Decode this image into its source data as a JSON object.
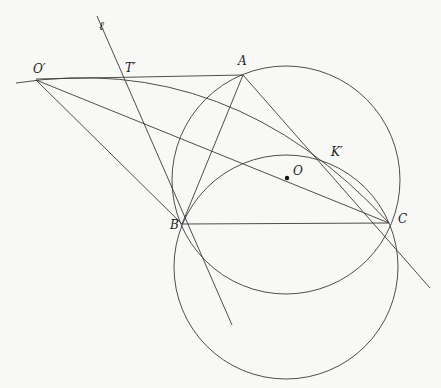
{
  "diagram": {
    "title": "",
    "stroke_color": "#3a3a3a",
    "points": {
      "O_prime": {
        "label": "O′",
        "x": 36,
        "y": 80
      },
      "T_prime": {
        "label": "T′",
        "x": 122,
        "y": 77
      },
      "A": {
        "label": "A",
        "x": 243,
        "y": 75
      },
      "K_prime": {
        "label": "K′",
        "x": 325,
        "y": 158
      },
      "O": {
        "label": "O",
        "x": 287,
        "y": 178
      },
      "B": {
        "label": "B",
        "x": 182,
        "y": 224
      },
      "C": {
        "label": "C",
        "x": 389,
        "y": 223
      }
    },
    "line_label": "ℓ",
    "circles": [
      {
        "name": "circumcircle-ABC",
        "cx": 286,
        "cy": 180,
        "r": 114
      },
      {
        "name": "lower-circle-BC",
        "cx": 286,
        "cy": 268,
        "r": 112
      }
    ],
    "segments": [
      "O′A",
      "O′B",
      "O′C",
      "AB",
      "AC",
      "BC",
      "line ℓ through T′ and B",
      "line through K′ and C extended"
    ],
    "arcs": [
      "arc through O′, K′, C"
    ]
  }
}
